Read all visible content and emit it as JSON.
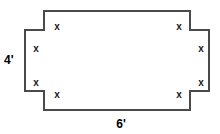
{
  "figure": {
    "type": "geometry-diagram",
    "sheet": {
      "width_label": "6'",
      "height_label": "4'",
      "border_color": "#4a4a4a",
      "fill_color": "#ffffff"
    },
    "corner_cuts": {
      "count": 4,
      "side_label": "x",
      "positions": [
        "top-left",
        "top-right",
        "bottom-left",
        "bottom-right"
      ]
    },
    "x_labels": [
      {
        "id": "top-left-horizontal",
        "text": "x"
      },
      {
        "id": "top-right-horizontal",
        "text": "x"
      },
      {
        "id": "left-upper-vertical",
        "text": "x"
      },
      {
        "id": "left-lower-vertical",
        "text": "x"
      },
      {
        "id": "right-upper-vertical",
        "text": "x"
      },
      {
        "id": "right-lower-vertical",
        "text": "x"
      },
      {
        "id": "bottom-left-horizontal",
        "text": "x"
      },
      {
        "id": "bottom-right-horizontal",
        "text": "x"
      }
    ],
    "dimensions": {
      "height": "4'",
      "width": "6'"
    },
    "colors": {
      "stroke": "#4a4a4a",
      "text": "#1a1a1a",
      "dimension_text": "#000000",
      "background": "#ffffff"
    }
  }
}
